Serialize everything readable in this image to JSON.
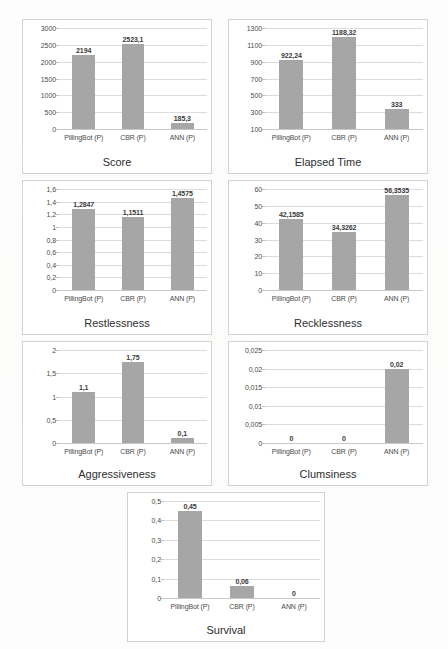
{
  "figure": {
    "categories": [
      "PillingBot (P)",
      "CBR (P)",
      "ANN (P)"
    ],
    "bar_color": "#a6a6a6",
    "grid_color": "#dcdcdc",
    "panel_border_color": "#d2d2d2"
  },
  "chart_data": [
    {
      "type": "bar",
      "title": "Score",
      "xlabel": "",
      "ylabel": "",
      "categories": [
        "PillingBot (P)",
        "CBR (P)",
        "ANN (P)"
      ],
      "values": [
        2194,
        2523.1,
        185.3
      ],
      "labels": [
        "2194",
        "2523,1",
        "185,3"
      ],
      "yticks": [
        0,
        500,
        1000,
        1500,
        2000,
        2500,
        3000
      ],
      "ytick_labels": [
        "0",
        "500",
        "1000",
        "1500",
        "2000",
        "2500",
        "3000"
      ],
      "ylim": [
        0,
        3000
      ],
      "grid": true,
      "legend": false
    },
    {
      "type": "bar",
      "title": "Elapsed Time",
      "xlabel": "",
      "ylabel": "",
      "categories": [
        "PillingBot (P)",
        "CBR (P)",
        "ANN (P)"
      ],
      "values": [
        922.24,
        1188.32,
        333
      ],
      "labels": [
        "922,24",
        "1188,32",
        "333"
      ],
      "yticks": [
        100,
        300,
        500,
        700,
        900,
        1100,
        1300
      ],
      "ytick_labels": [
        "100",
        "300",
        "500",
        "700",
        "900",
        "1100",
        "1300"
      ],
      "ylim": [
        100,
        1300
      ],
      "grid": true,
      "legend": false
    },
    {
      "type": "bar",
      "title": "Restlessness",
      "xlabel": "",
      "ylabel": "",
      "categories": [
        "PillingBot (P)",
        "CBR (P)",
        "ANN (P)"
      ],
      "values": [
        1.2847,
        1.1511,
        1.4575
      ],
      "labels": [
        "1,2847",
        "1,1511",
        "1,4575"
      ],
      "yticks": [
        0,
        0.2,
        0.4,
        0.6,
        0.8,
        1,
        1.2,
        1.4,
        1.6
      ],
      "ytick_labels": [
        "0",
        "0,2",
        "0,4",
        "0,6",
        "0,8",
        "1",
        "1,2",
        "1,4",
        "1,6"
      ],
      "ylim": [
        0,
        1.6
      ],
      "grid": true,
      "legend": false
    },
    {
      "type": "bar",
      "title": "Recklessness",
      "xlabel": "",
      "ylabel": "",
      "categories": [
        "PillingBot (P)",
        "CBR (P)",
        "ANN (P)"
      ],
      "values": [
        42.1585,
        34.3262,
        56.3535
      ],
      "labels": [
        "42,1585",
        "34,3262",
        "56,3535"
      ],
      "yticks": [
        0,
        10,
        20,
        30,
        40,
        50,
        60
      ],
      "ytick_labels": [
        "0",
        "10",
        "20",
        "30",
        "40",
        "50",
        "60"
      ],
      "ylim": [
        0,
        60
      ],
      "grid": true,
      "legend": false
    },
    {
      "type": "bar",
      "title": "Aggressiveness",
      "xlabel": "",
      "ylabel": "",
      "categories": [
        "PillingBot (P)",
        "CBR (P)",
        "ANN (P)"
      ],
      "values": [
        1.1,
        1.75,
        0.1
      ],
      "labels": [
        "1,1",
        "1,75",
        "0,1"
      ],
      "yticks": [
        0,
        0.5,
        1,
        1.5,
        2
      ],
      "ytick_labels": [
        "0",
        "0,5",
        "1",
        "1,5",
        "2"
      ],
      "ylim": [
        0,
        2
      ],
      "grid": true,
      "legend": false
    },
    {
      "type": "bar",
      "title": "Clumsiness",
      "xlabel": "",
      "ylabel": "",
      "categories": [
        "PillingBot (P)",
        "CBR (P)",
        "ANN (P)"
      ],
      "values": [
        0,
        0,
        0.02
      ],
      "labels": [
        "0",
        "0",
        "0,02"
      ],
      "yticks": [
        0,
        0.005,
        0.01,
        0.015,
        0.02,
        0.025
      ],
      "ytick_labels": [
        "0",
        "0,005",
        "0,01",
        "0,015",
        "0,02",
        "0,025"
      ],
      "ylim": [
        0,
        0.025
      ],
      "grid": true,
      "legend": false
    },
    {
      "type": "bar",
      "title": "Survival",
      "xlabel": "",
      "ylabel": "",
      "categories": [
        "PillingBot (P)",
        "CBR (P)",
        "ANN (P)"
      ],
      "values": [
        0.45,
        0.06,
        0
      ],
      "labels": [
        "0,45",
        "0,06",
        "0"
      ],
      "yticks": [
        0,
        0.1,
        0.2,
        0.3,
        0.4,
        0.5
      ],
      "ytick_labels": [
        "0",
        "0,1",
        "0,2",
        "0,3",
        "0,4",
        "0,5"
      ],
      "ylim": [
        0,
        0.5
      ],
      "grid": true,
      "legend": false
    }
  ]
}
